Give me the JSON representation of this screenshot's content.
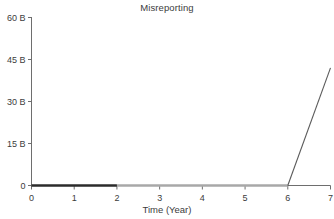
{
  "chart_data": {
    "type": "line",
    "title": "Misreporting",
    "xlabel": "Time (Year)",
    "ylabel": "",
    "xlim": [
      0,
      7
    ],
    "ylim": [
      0,
      60
    ],
    "grid": false,
    "legend": "none",
    "x_tick_labels": [
      "0",
      "1",
      "2",
      "3",
      "4",
      "5",
      "6",
      "7"
    ],
    "x_tick_values": [
      0,
      1,
      2,
      3,
      4,
      5,
      6,
      7
    ],
    "y_tick_labels": [
      "0",
      "15 B",
      "30 B",
      "45 B",
      "60 B"
    ],
    "y_tick_values": [
      0,
      15,
      30,
      45,
      60
    ],
    "y_unit": "B",
    "x": [
      0,
      1,
      2,
      3,
      4,
      5,
      6,
      7
    ],
    "values": [
      0,
      0,
      0,
      0,
      0,
      0,
      0,
      42
    ],
    "series": [
      {
        "name": "Misreporting",
        "x": [
          0,
          1,
          2,
          3,
          4,
          5,
          6,
          7
        ],
        "values": [
          0,
          0,
          0,
          0,
          0,
          0,
          0,
          42
        ],
        "color": "#5a5a5a"
      }
    ],
    "segments": [
      {
        "name": "flat-dark-segment",
        "x_start": 0,
        "x_end": 2,
        "y_start": 0,
        "y_end": 0,
        "color": "#2b2b2b",
        "width": 2.6
      },
      {
        "name": "flat-gray-segment",
        "x_start": 2,
        "x_end": 6,
        "y_start": 0,
        "y_end": 0,
        "color": "#a8a8a8",
        "width": 2.6
      },
      {
        "name": "rising-segment",
        "x_start": 6,
        "x_end": 7,
        "y_start": 0,
        "y_end": 42,
        "color": "#5a5a5a",
        "width": 1.1
      }
    ],
    "annotations": []
  },
  "axes": {
    "axis_color": "#6e6e6e",
    "tick_color": "#6e6e6e",
    "text_color": "#3c3c3c",
    "background": "#ffffff"
  }
}
